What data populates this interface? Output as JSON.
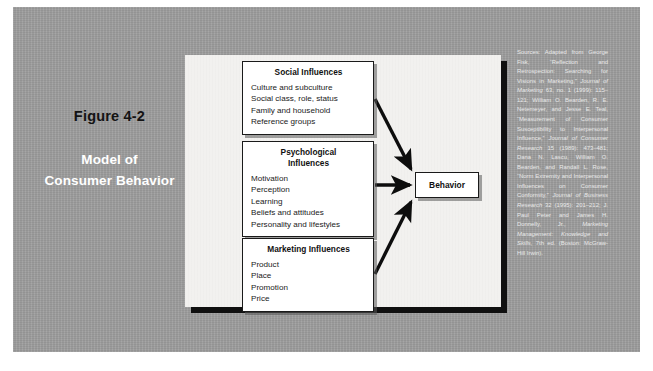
{
  "slide": {
    "caption": {
      "figure_label": "Figure 4-2",
      "title_line1": "Model of",
      "title_line2": "Consumer Behavior"
    },
    "colors": {
      "background_field": "#9d9d9d",
      "panel": "#f2f1ef",
      "box_border": "#1a1a1a",
      "caption_title": "#ffffff",
      "figure_label": "#131313",
      "sources_text": "#e9e9e9"
    }
  },
  "diagram": {
    "boxes": [
      {
        "id": "social",
        "title": "Social Influences",
        "items": [
          "Culture and subculture",
          "Social class, role, status",
          "Family and household",
          "Reference groups"
        ]
      },
      {
        "id": "psychological",
        "title_line1": "Psychological",
        "title_line2": "Influences",
        "items": [
          "Motivation",
          "Perception",
          "Learning",
          "Beliefs and attitudes",
          "Personality and lifestyles"
        ]
      },
      {
        "id": "marketing",
        "title": "Marketing Influences",
        "items": [
          "Product",
          "Place",
          "Promotion",
          "Price"
        ]
      }
    ],
    "outcome": {
      "label": "Behavior"
    },
    "arrows": [
      {
        "from": "social",
        "to": "outcome"
      },
      {
        "from": "psychological",
        "to": "outcome"
      },
      {
        "from": "marketing",
        "to": "outcome"
      }
    ]
  },
  "sources": {
    "segments": [
      {
        "text": "Sources: Adapted from George Fisk, “Reflection and Retrospection: Searching for Visions in Marketing,” ",
        "italic": false
      },
      {
        "text": "Journal of Marketing",
        "italic": true
      },
      {
        "text": " 63, no. 1 (1999): 115–121; William O. Bearden, R. E. Netemeyer, and Jesse E. Teal, “Measurement of Consumer Susceptibility to Interpersonal Influence,” ",
        "italic": false
      },
      {
        "text": "Journal of Consumer Research",
        "italic": true
      },
      {
        "text": " 15 (1989): 473–481; Dana N. Lascu, William O. Bearden, and Randall L. Rose, “Norm Extremity and Interpersonal Influences on Consumer Conformity,” ",
        "italic": false
      },
      {
        "text": "Journal of Business Research",
        "italic": true
      },
      {
        "text": " 32 (1995): 201–212; J. Paul Peter and James H. Donnelly, Jr., ",
        "italic": false
      },
      {
        "text": "Marketing Management: Knowledge and Skills,",
        "italic": true
      },
      {
        "text": " 7th ed. (Boston: McGraw-Hill Irwin).",
        "italic": false
      }
    ]
  }
}
